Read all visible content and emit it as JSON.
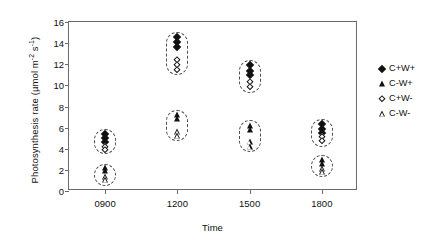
{
  "chart_data": {
    "type": "scatter",
    "title": "",
    "xlabel": "Time",
    "ylabel": "Photosynthesis rate (µmol m⁻² s⁻¹)",
    "ylabel_main": "Photosynthesis rate (µmol m",
    "ylabel_sup1": "-2",
    "ylabel_mid": " s",
    "ylabel_sup2": "-1",
    "ylabel_end": ")",
    "ylim": [
      0,
      16
    ],
    "yticks": [
      0,
      2,
      4,
      6,
      8,
      10,
      12,
      14,
      16
    ],
    "ytick_labels": [
      "0",
      "2",
      "4",
      "6",
      "8",
      "10",
      "12",
      "14",
      "16"
    ],
    "categories": [
      "0900",
      "1200",
      "1500",
      "1800"
    ],
    "xtick_labels": [
      "0900",
      "1200",
      "1500",
      "1800"
    ],
    "grid": false,
    "legend_position": "right",
    "legend": [
      {
        "label": "C+W+",
        "marker": "filled-diamond"
      },
      {
        "label": "C-W+",
        "marker": "filled-triangle"
      },
      {
        "label": "C+W-",
        "marker": "open-diamond"
      },
      {
        "label": "C-W-",
        "marker": "open-triangle"
      }
    ],
    "series": [
      {
        "name": "C+W+",
        "marker": "filled-diamond",
        "points": [
          {
            "x": "0900",
            "y": 5.4
          },
          {
            "x": "0900",
            "y": 5.0
          },
          {
            "x": "0900",
            "y": 4.6
          },
          {
            "x": "1200",
            "y": 14.6
          },
          {
            "x": "1200",
            "y": 14.1
          },
          {
            "x": "1200",
            "y": 13.6
          },
          {
            "x": "1500",
            "y": 11.9
          },
          {
            "x": "1500",
            "y": 11.4
          },
          {
            "x": "1500",
            "y": 11.0
          },
          {
            "x": "1800",
            "y": 6.3
          },
          {
            "x": "1800",
            "y": 5.9
          },
          {
            "x": "1800",
            "y": 5.5
          }
        ]
      },
      {
        "name": "C-W+",
        "marker": "filled-triangle",
        "points": [
          {
            "x": "0900",
            "y": 2.2
          },
          {
            "x": "0900",
            "y": 1.9
          },
          {
            "x": "1200",
            "y": 7.2
          },
          {
            "x": "1200",
            "y": 6.8
          },
          {
            "x": "1500",
            "y": 6.2
          },
          {
            "x": "1500",
            "y": 5.8
          },
          {
            "x": "1800",
            "y": 2.9
          },
          {
            "x": "1800",
            "y": 2.6
          }
        ]
      },
      {
        "name": "C+W-",
        "marker": "open-diamond",
        "points": [
          {
            "x": "0900",
            "y": 4.2
          },
          {
            "x": "0900",
            "y": 3.9
          },
          {
            "x": "1200",
            "y": 12.4
          },
          {
            "x": "1200",
            "y": 11.9
          },
          {
            "x": "1200",
            "y": 11.5
          },
          {
            "x": "1500",
            "y": 10.3
          },
          {
            "x": "1500",
            "y": 9.8
          },
          {
            "x": "1800",
            "y": 5.1
          },
          {
            "x": "1800",
            "y": 4.7
          }
        ]
      },
      {
        "name": "C-W-",
        "marker": "open-triangle",
        "points": [
          {
            "x": "0900",
            "y": 1.3
          },
          {
            "x": "0900",
            "y": 1.0
          },
          {
            "x": "1200",
            "y": 5.6
          },
          {
            "x": "1200",
            "y": 5.2
          },
          {
            "x": "1500",
            "y": 4.6
          },
          {
            "x": "1500",
            "y": 4.2
          },
          {
            "x": "1800",
            "y": 2.1
          },
          {
            "x": "1800",
            "y": 1.8
          }
        ]
      }
    ],
    "clusters": [
      {
        "x": "0900",
        "y_top": 5.9,
        "y_bottom": 3.5,
        "label": "0900-upper-group"
      },
      {
        "x": "0900",
        "y_top": 2.6,
        "y_bottom": 0.5,
        "label": "0900-lower-group"
      },
      {
        "x": "1200",
        "y_top": 15.1,
        "y_bottom": 11.0,
        "label": "1200-upper-group"
      },
      {
        "x": "1200",
        "y_top": 7.7,
        "y_bottom": 4.7,
        "label": "1200-lower-group"
      },
      {
        "x": "1500",
        "y_top": 12.4,
        "y_bottom": 9.3,
        "label": "1500-upper-group"
      },
      {
        "x": "1500",
        "y_top": 6.7,
        "y_bottom": 3.7,
        "label": "1500-lower-group"
      },
      {
        "x": "1800",
        "y_top": 6.8,
        "y_bottom": 4.2,
        "label": "1800-upper-group"
      },
      {
        "x": "1800",
        "y_top": 3.4,
        "y_bottom": 1.3,
        "label": "1800-lower-group"
      }
    ]
  },
  "colors": {
    "marker": "#111111",
    "axis": "#6b6b6b",
    "capsule": "#4d4d4d",
    "background": "#ffffff"
  }
}
